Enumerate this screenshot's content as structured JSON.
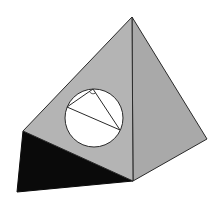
{
  "diagram": {
    "colors": {
      "background": "#ffffff",
      "front_face": "#b4b4b4",
      "right_face": "#a9a9a9",
      "bottom_face": "#0a0a0a",
      "edge": "#2a2a2a",
      "circle_fill": "#ffffff"
    },
    "vertices": {
      "apex": [
        132,
        17
      ],
      "left": [
        23,
        131
      ],
      "bottom_left": [
        17,
        192
      ],
      "bottom": [
        133,
        181
      ],
      "right": [
        207,
        139
      ]
    },
    "circle": {
      "center": [
        94,
        118
      ],
      "radius": 29
    },
    "inscribed_triangle": {
      "top": [
        93,
        89
      ],
      "left": [
        67,
        107
      ],
      "bottom_right": [
        120,
        130
      ],
      "right_angle_at": "top"
    }
  }
}
